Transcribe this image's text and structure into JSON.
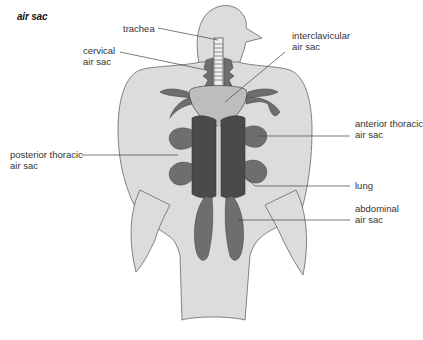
{
  "title": "air sac",
  "labels": {
    "trachea": "trachea",
    "cervical": "cervical\nair sac",
    "interclavicular": "interclavicular\nair sac",
    "anterior_thoracic": "anterior thoracic\nair sac",
    "posterior_thoracic": "posterior thoracic\nair sac",
    "lung": "lung",
    "abdominal": "abdominal\nair sac"
  },
  "colors": {
    "body": "#dcdcdc",
    "outline": "#555555",
    "air_sac_dark": "#6e6e6e",
    "air_sac_light": "#bdbdbd",
    "lung": "#4a4a4a",
    "leader_line": "#444444"
  }
}
